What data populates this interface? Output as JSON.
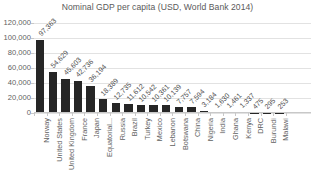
{
  "chart_data": {
    "type": "bar",
    "title": "Nominal GDP per capita (USD, World Bank 2014)",
    "xlabel": "",
    "ylabel": "",
    "ylim": [
      0,
      120000
    ],
    "ytick_labels": [
      "120,000",
      "100,000",
      "80,000",
      "60,000",
      "40,000",
      "20,000",
      "0"
    ],
    "yticks": [
      120000,
      100000,
      80000,
      60000,
      40000,
      20000,
      0
    ],
    "grid": true,
    "legend": "none",
    "orientation": "vertical",
    "bar_color": "#262626",
    "categories": [
      "Norway",
      "United States",
      "United Kingdom",
      "France",
      "Japan",
      "Equatorial...",
      "Russia",
      "Brazil",
      "Turkey",
      "Mexico",
      "Lebanon",
      "Botswana",
      "China",
      "Nigeria",
      "India",
      "Ghana",
      "Kenya",
      "DRC",
      "Burundi",
      "Malawi"
    ],
    "values": [
      97363,
      54629,
      45603,
      42736,
      36194,
      18389,
      12735,
      11612,
      10542,
      10361,
      10139,
      7757,
      7594,
      3184,
      1630,
      1461,
      1337,
      475,
      295,
      253
    ],
    "value_labels": [
      "97,363",
      "54,629",
      "45,603",
      "42,736",
      "36,194",
      "18,389",
      "12,735",
      "11,612",
      "10,542",
      "10,361",
      "10,139",
      "7,757",
      "7,594",
      "3,184",
      "1,630",
      "1,461",
      "1,337",
      "475",
      "295",
      "253"
    ]
  }
}
